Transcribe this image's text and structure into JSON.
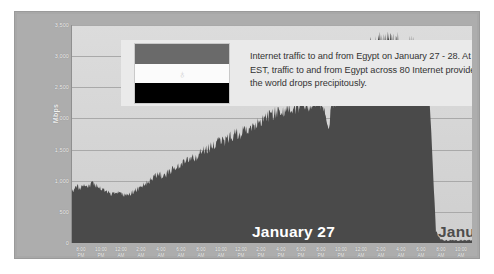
{
  "annotation": {
    "text": "Internet traffic to and from Egypt on January 27 - 28. At 5:20 pm EST, traffic to and from Egypt across 80 Internet providers around the world  drops precipitously.",
    "flag_name": "egypt-flag",
    "flag_emblem": "♁"
  },
  "credit": "Credit: Arbor Networks",
  "day_labels": {
    "left": "January 27",
    "right": "January 28"
  },
  "colors": {
    "card_frame": "#a8a8a8",
    "plot_background": "#d7d7d7",
    "traffic_fill": "#4a4a4a",
    "gridline": "#a9a9a9",
    "annotation_panel": "#eaeaea",
    "day27_text": "#ffffff",
    "day28_text": "#4d4d4d"
  },
  "chart_data": {
    "type": "area",
    "title": "",
    "subtitle": "",
    "xlabel": "",
    "ylabel": "Mbps",
    "ylim": [
      0,
      3500
    ],
    "grid": true,
    "legend": "none",
    "annotations": [
      "Internet traffic to and from Egypt on January 27 - 28. At 5:20 pm EST, traffic to and from Egypt across 80 Internet providers around the world  drops precipitously.",
      "January 27",
      "January 28",
      "Credit: Arbor Networks"
    ],
    "yticks": [
      "3,500",
      "3,000",
      "2,500",
      "2,000",
      "1,500",
      "1,000",
      "500",
      "0"
    ],
    "ytick_values": [
      3500,
      3000,
      2500,
      2000,
      1500,
      1000,
      500,
      0
    ],
    "xticks": [
      {
        "time": "8:00",
        "ampm": "PM"
      },
      {
        "time": "10:00",
        "ampm": "PM"
      },
      {
        "time": "12:00",
        "ampm": "AM"
      },
      {
        "time": "2:00",
        "ampm": "AM"
      },
      {
        "time": "4:00",
        "ampm": "AM"
      },
      {
        "time": "6:00",
        "ampm": "AM"
      },
      {
        "time": "8:00",
        "ampm": "AM"
      },
      {
        "time": "10:00",
        "ampm": "AM"
      },
      {
        "time": "12:00",
        "ampm": "PM"
      },
      {
        "time": "2:00",
        "ampm": "PM"
      },
      {
        "time": "4:00",
        "ampm": "PM"
      },
      {
        "time": "6:00",
        "ampm": "PM"
      },
      {
        "time": "8:00",
        "ampm": "PM"
      },
      {
        "time": "10:00",
        "ampm": "PM"
      },
      {
        "time": "12:00",
        "ampm": "AM"
      },
      {
        "time": "2:00",
        "ampm": "AM"
      },
      {
        "time": "4:00",
        "ampm": "AM"
      },
      {
        "time": "6:00",
        "ampm": "AM"
      },
      {
        "time": "8:00",
        "ampm": "AM"
      },
      {
        "time": "10:00",
        "ampm": "AM"
      }
    ],
    "series": [
      {
        "name": "Egypt Internet traffic (Mbps)",
        "x": [
          0,
          1,
          2,
          3,
          4,
          5,
          6,
          7,
          8,
          9,
          10,
          11,
          12,
          13,
          14,
          15,
          16,
          17,
          18,
          19,
          20,
          21,
          22,
          23,
          24,
          25,
          26,
          27,
          28,
          29,
          30,
          31,
          32,
          33,
          34,
          35,
          36,
          37,
          38,
          39,
          40,
          41,
          42,
          43,
          44,
          45,
          46,
          47,
          48,
          49,
          50,
          51,
          52,
          53,
          54,
          55,
          56,
          57,
          58,
          59,
          60,
          61,
          62,
          63,
          64,
          65,
          66,
          67,
          68,
          69,
          70,
          71,
          72,
          73,
          74,
          75,
          76,
          77,
          78,
          79,
          80,
          81,
          82,
          83,
          84,
          85,
          86,
          87,
          88,
          89,
          90,
          91,
          92,
          93,
          94,
          95,
          96,
          97,
          98,
          99,
          100
        ],
        "values": [
          820,
          905,
          860,
          930,
          880,
          960,
          905,
          870,
          840,
          815,
          790,
          830,
          800,
          775,
          760,
          800,
          840,
          890,
          935,
          980,
          1020,
          1065,
          1095,
          1050,
          1120,
          1170,
          1210,
          1255,
          1300,
          1345,
          1390,
          1360,
          1430,
          1470,
          1500,
          1545,
          1580,
          1620,
          1600,
          1660,
          1700,
          1740,
          1720,
          1785,
          1830,
          1870,
          1900,
          1940,
          1975,
          2010,
          2050,
          2080,
          2120,
          2060,
          2140,
          2175,
          2160,
          2195,
          2210,
          2180,
          2230,
          2205,
          2240,
          2190,
          1760,
          2250,
          2275,
          2540,
          2780,
          2950,
          3060,
          3010,
          3110,
          3150,
          3090,
          3180,
          3130,
          3200,
          3160,
          3220,
          3190,
          3240,
          3170,
          3210,
          3140,
          3180,
          3090,
          3050,
          2960,
          2700,
          1500,
          180,
          60,
          45,
          40,
          42,
          38,
          44,
          40,
          43,
          41
        ]
      }
    ],
    "event": {
      "label": "Traffic shutdown",
      "time": "5:20 pm EST",
      "date": "January 27"
    }
  }
}
